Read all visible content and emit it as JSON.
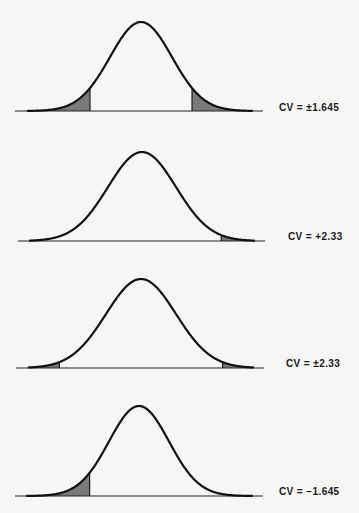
{
  "chart_data": [
    {
      "type": "area",
      "title": "Two-tailed test, alpha = 0.10",
      "distribution": "standard normal",
      "label": "CV = ±1.645",
      "critical_values": [
        -1.645,
        1.645
      ],
      "shaded_regions": [
        "left tail",
        "right tail"
      ],
      "layout": {
        "baseline_y": 111,
        "peak_y": 22,
        "center_x": 141,
        "sigma_px": 31,
        "x_from": 15,
        "x_to": 263,
        "curve_from": 28,
        "curve_to": 252,
        "label_x": 279,
        "label_y": 102
      }
    },
    {
      "type": "area",
      "title": "One-tailed (right) test, alpha = 0.01",
      "distribution": "standard normal",
      "label": "CV = +2.33",
      "critical_values": [
        2.33
      ],
      "shaded_regions": [
        "right tail"
      ],
      "layout": {
        "baseline_y": 241,
        "peak_y": 152,
        "center_x": 142,
        "sigma_px": 34,
        "x_from": 18,
        "x_to": 265,
        "curve_from": 30,
        "curve_to": 254,
        "label_x": 288,
        "label_y": 231
      }
    },
    {
      "type": "area",
      "title": "Two-tailed test, alpha = 0.02",
      "distribution": "standard normal",
      "label": "CV = ±2.33",
      "critical_values": [
        -2.33,
        2.33
      ],
      "shaded_regions": [
        "left tail",
        "right tail"
      ],
      "layout": {
        "baseline_y": 368,
        "peak_y": 279,
        "center_x": 141,
        "sigma_px": 35,
        "x_from": 16,
        "x_to": 264,
        "curve_from": 29,
        "curve_to": 253,
        "label_x": 286,
        "label_y": 358
      }
    },
    {
      "type": "area",
      "title": "One-tailed (left) test, alpha = 0.05",
      "distribution": "standard normal",
      "label": "CV = −1.645",
      "critical_values": [
        -1.645
      ],
      "shaded_regions": [
        "left tail"
      ],
      "layout": {
        "baseline_y": 496,
        "peak_y": 406,
        "center_x": 139,
        "sigma_px": 30,
        "x_from": 15,
        "x_to": 263,
        "curve_from": 27,
        "curve_to": 252,
        "label_x": 279,
        "label_y": 486
      }
    }
  ],
  "style": {
    "background": "#f6f6f4",
    "curve_color": "#111111",
    "shade_color": "#7a7a7a",
    "axis_color": "#222222"
  },
  "labels": {
    "panel1": "CV = ±1.645",
    "panel2": "CV = +2.33",
    "panel3": "CV = ±2.33",
    "panel4": "CV = −1.645"
  }
}
